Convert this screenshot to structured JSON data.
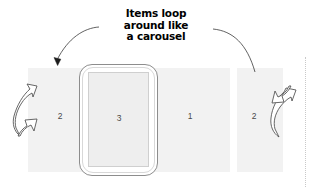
{
  "diagram": {
    "caption": {
      "lines": [
        "Items loop",
        "around like",
        "a carousel"
      ],
      "full_text": "Items loop around like a carousel"
    },
    "panels": [
      {
        "id": "panel-left-2",
        "label": "2",
        "x": 28,
        "y": 68,
        "w": 57,
        "h": 104
      },
      {
        "id": "panel-center-3",
        "label": "3",
        "x": 88,
        "y": 72,
        "w": 61,
        "h": 95
      },
      {
        "id": "panel-right-1",
        "label": "1",
        "x": 152,
        "y": 68,
        "w": 78,
        "h": 104
      },
      {
        "id": "panel-right-2",
        "label": "2",
        "x": 237,
        "y": 68,
        "w": 46,
        "h": 104
      }
    ],
    "device": {
      "name": "tablet-frame",
      "screen_label": "3"
    },
    "arrows": {
      "left_loop": "hollow arrow curving down and to the left",
      "right_loop": "hollow arrow curving up and to the right",
      "caption_left": "thin curved pointer to left panel",
      "caption_right": "thin curved pointer to right panel"
    },
    "colors": {
      "panel_fill": "#f2f2f2",
      "screen_fill": "#eeeeee",
      "device_stroke": "#8d8d8d",
      "arrow_stroke": "#5a5a5a",
      "text": "#000000",
      "number_text": "#4a4a4a",
      "background": "#ffffff"
    }
  }
}
